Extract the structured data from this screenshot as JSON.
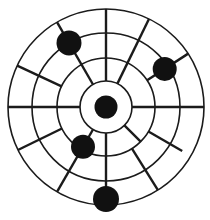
{
  "figure": {
    "name": "radial-target-diagram",
    "background_color": "#ffffff",
    "line_color": "#1b1b1b",
    "dot_color": "#111111",
    "center": {
      "x": 106,
      "y": 107
    },
    "ring_radii": [
      26,
      49,
      74,
      98
    ],
    "ring_stroke_width": 1.6,
    "spoke_stroke_width": 2.4,
    "spokes": [
      {
        "angle_deg": 0,
        "r_from": 26,
        "r_to": 98
      },
      {
        "angle_deg": 33,
        "r_from": 49,
        "r_to": 98
      },
      {
        "angle_deg": 64,
        "r_from": 26,
        "r_to": 98
      },
      {
        "angle_deg": 90,
        "r_from": 26,
        "r_to": 98
      },
      {
        "angle_deg": 120,
        "r_from": 26,
        "r_to": 98
      },
      {
        "angle_deg": 155,
        "r_from": 49,
        "r_to": 98
      },
      {
        "angle_deg": 180,
        "r_from": 26,
        "r_to": 98
      },
      {
        "angle_deg": 206,
        "r_from": 49,
        "r_to": 98
      },
      {
        "angle_deg": 240,
        "r_from": 26,
        "r_to": 98
      },
      {
        "angle_deg": 270,
        "r_from": 26,
        "r_to": 98
      },
      {
        "angle_deg": 302,
        "r_from": 49,
        "r_to": 98
      },
      {
        "angle_deg": 315,
        "r_from": 26,
        "r_to": 49
      },
      {
        "angle_deg": 330,
        "r_from": 49,
        "r_to": 88
      }
    ],
    "dots": [
      {
        "label": "center-dot",
        "angle_deg": 0,
        "dist": 0,
        "radius": 11.5
      },
      {
        "label": "upper-right-dot",
        "angle_deg": 33,
        "dist": 70,
        "radius": 12
      },
      {
        "label": "upper-left-dot",
        "angle_deg": 120,
        "dist": 74,
        "radius": 12.5
      },
      {
        "label": "lower-left-dot",
        "angle_deg": 240,
        "dist": 46,
        "radius": 12
      },
      {
        "label": "bottom-dot",
        "angle_deg": 270,
        "dist": 92,
        "radius": 13
      }
    ]
  }
}
